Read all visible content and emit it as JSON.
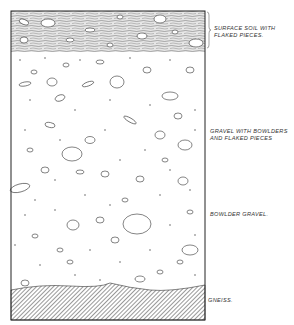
{
  "figure": {
    "type": "geological stratigraphic section",
    "colors": {
      "ink": "#222222",
      "paper": "#ffffff"
    },
    "layers": [
      {
        "id": "surface-soil",
        "label_line1": "SURFACE SOIL WITH",
        "label_line2": "FLAKED PIECES.",
        "top": 11,
        "bottom": 52
      },
      {
        "id": "gravel-bowlders",
        "label_line1": "GRAVEL WITH BOWLDERS",
        "label_line2": "AND FLAKED PIECES",
        "top": 52,
        "bottom": 200
      },
      {
        "id": "bowlder-gravel",
        "label_line1": "BOWLDER GRAVEL.",
        "label_line2": "",
        "top": 200,
        "bottom": 288
      },
      {
        "id": "gneiss",
        "label_line1": "GNEISS.",
        "label_line2": "",
        "top": 288,
        "bottom": 320
      }
    ]
  }
}
